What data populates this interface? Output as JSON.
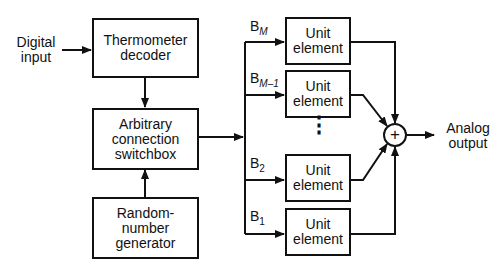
{
  "diagram": {
    "input_label": [
      "Digital",
      "input"
    ],
    "output_label": [
      "Analog",
      "output"
    ],
    "blocks": {
      "thermometer": [
        "Thermometer",
        "decoder"
      ],
      "switchbox": [
        "Arbitrary",
        "connection",
        "switchbox"
      ],
      "rng": [
        "Random-",
        "number",
        "generator"
      ]
    },
    "unit_elements": [
      {
        "bit": "B",
        "sub": "M",
        "label": [
          "Unit",
          "element"
        ]
      },
      {
        "bit": "B",
        "sub": "M–1",
        "label": [
          "Unit",
          "element"
        ]
      },
      {
        "bit": "B",
        "sub": "2",
        "label": [
          "Unit",
          "element"
        ]
      },
      {
        "bit": "B",
        "sub": "1",
        "label": [
          "Unit",
          "element"
        ]
      }
    ],
    "summer_symbol": "+",
    "ellipsis": "⋮"
  }
}
